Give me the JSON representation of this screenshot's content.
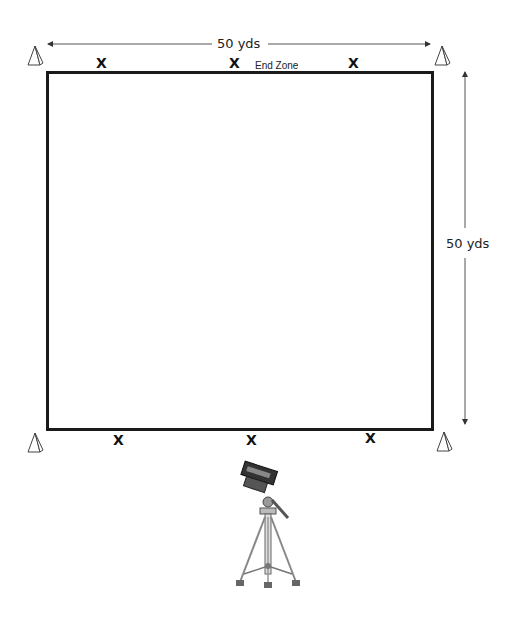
{
  "diagram": {
    "field": {
      "width_label": "50 yds",
      "height_label": "50 yds",
      "end_zone_label": "End Zone"
    },
    "cones": [
      {
        "id": "top-left",
        "icon": "cone-icon"
      },
      {
        "id": "top-right",
        "icon": "cone-icon"
      },
      {
        "id": "bottom-left",
        "icon": "cone-icon"
      },
      {
        "id": "bottom-right",
        "icon": "cone-icon"
      }
    ],
    "players_top": [
      "X",
      "X",
      "X"
    ],
    "players_bottom": [
      "X",
      "X",
      "X"
    ],
    "camera": {
      "icon": "camera-tripod-icon"
    },
    "colors": {
      "line": "#1a1a1a",
      "arrow": "#555555",
      "background": "#ffffff"
    }
  }
}
